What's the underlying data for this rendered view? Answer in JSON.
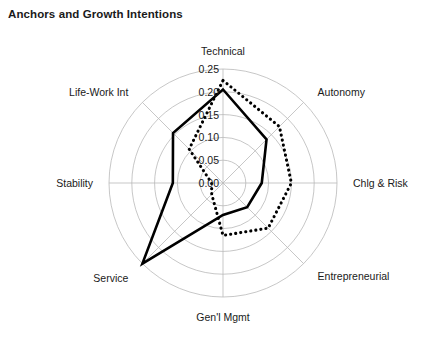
{
  "chart_data": {
    "type": "radar",
    "title": "Anchors and Growth Intentions",
    "categories": [
      "Technical",
      "Autonomy",
      "Chlg & Risk",
      "Entrepreneurial",
      "Gen'l Mgmt",
      "Service",
      "Stability",
      "Life-Work Int"
    ],
    "rticks": [
      "0.00",
      "0.05",
      "0.10",
      "0.15",
      "0.20",
      "0.25"
    ],
    "rlim": [
      0.0,
      0.25
    ],
    "grid": true,
    "legend": "none",
    "xlabel": "",
    "ylabel": "",
    "series": [
      {
        "name": "Solid",
        "style": "solid",
        "values": [
          0.205,
          0.135,
          0.085,
          0.075,
          0.07,
          0.25,
          0.11,
          0.155
        ]
      },
      {
        "name": "Dotted",
        "style": "dotted",
        "values": [
          0.225,
          0.175,
          0.15,
          0.14,
          0.115,
          0.035,
          0.025,
          0.105
        ]
      }
    ],
    "geometry": {
      "cx": 223,
      "cy": 183,
      "radius": 114,
      "start_angle_deg": -90,
      "direction": "clockwise"
    }
  },
  "axis_labels": {
    "technical": "Technical",
    "autonomy": "Autonomy",
    "chlg_risk": "Chlg & Risk",
    "entrepreneurial": "Entrepreneurial",
    "genl_mgmt": "Gen'l Mgmt",
    "service": "Service",
    "stability": "Stability",
    "life_work": "Life-Work Int"
  },
  "ticks": {
    "t0": "0.00",
    "t1": "0.05",
    "t2": "0.10",
    "t3": "0.15",
    "t4": "0.20",
    "t5": "0.25"
  }
}
